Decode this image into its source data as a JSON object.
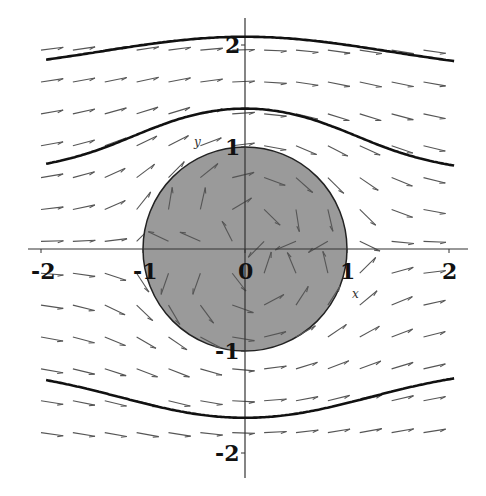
{
  "figure": {
    "xlim": [
      -2.05,
      2.05
    ],
    "ylim": [
      -2.05,
      2.05
    ],
    "origin_px": [
      245,
      249
    ],
    "scale_px_per_unit": 102,
    "axis_labels": {
      "x": "x",
      "y": "y"
    },
    "x_ticks": [
      {
        "value": -2,
        "label": "-2"
      },
      {
        "value": -1,
        "label": "-1"
      },
      {
        "value": 0,
        "label": "0"
      },
      {
        "value": 1,
        "label": "1"
      },
      {
        "value": 2,
        "label": "2"
      }
    ],
    "y_ticks": [
      {
        "value": 2,
        "label": "2"
      },
      {
        "value": 1,
        "label": "1"
      },
      {
        "value": -1,
        "label": "-1"
      },
      {
        "value": -2,
        "label": "-2"
      }
    ],
    "disk": {
      "radius": 1,
      "fill": "#9a9a9a",
      "stroke": "#222222"
    },
    "vector_field": {
      "formula": "F(x,y) = (1 - (x^2 - y^2)/r^4, -2xy/r^4)",
      "grid_x_start": -2.0,
      "grid_x_step": 0.3125,
      "grid_x_count": 13,
      "grid_y_start": 1.95,
      "grid_y_step": -0.3125,
      "grid_y_count": 13,
      "arrow_length_units": 0.22,
      "color": "#555555"
    },
    "streamlines": [
      {
        "label": "psi=1.6",
        "psi": 1.6
      },
      {
        "label": "psi=0.65",
        "psi": 0.65
      },
      {
        "label": "psi=-1.05",
        "psi": -1.05
      }
    ],
    "streamline_x_range": [
      -1.95,
      2.05
    ],
    "streamline_color": "#111111"
  }
}
